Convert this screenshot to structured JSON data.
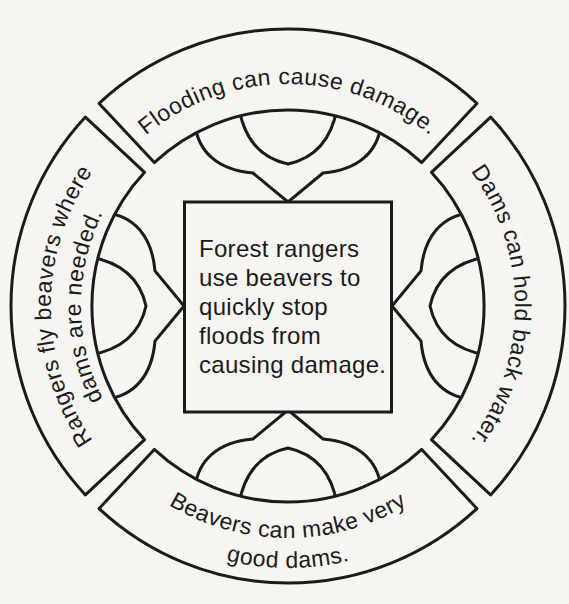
{
  "diagram": {
    "type": "concept-web",
    "colors": {
      "ink": "#1b1b1b",
      "paper": "#f6f5f1"
    },
    "center": {
      "text": "Forest rangers use beavers to quickly stop floods from causing damage.",
      "lines": [
        "Forest rangers",
        "use beavers to",
        "quickly stop",
        "floods from",
        "causing damage."
      ]
    },
    "banners": {
      "top": {
        "label": "Flooding can cause damage."
      },
      "right": {
        "label": "Dams can hold back water."
      },
      "bottom": {
        "label": "Beavers can make very good dams.",
        "line1": "Beavers can make very",
        "line2": "good dams."
      },
      "left": {
        "label": "Rangers fly beavers where dams are needed.",
        "line1": "Rangers fly beavers where",
        "line2": "dams are needed."
      }
    }
  }
}
